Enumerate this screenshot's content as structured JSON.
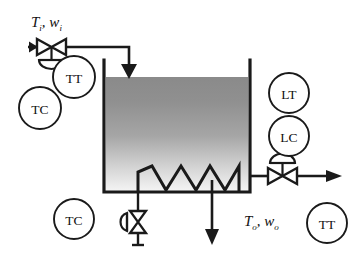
{
  "diagram": {
    "colors": {
      "line": "#1a1a1a",
      "liquid_top": "#8c8c8c",
      "liquid_bottom": "#f2f2f2",
      "background": "#ffffff"
    },
    "instruments": [
      {
        "id": "tt-inlet",
        "tag": "TT",
        "name": "inlet-temperature-transmitter",
        "cx": 74,
        "cy": 77,
        "r": 21
      },
      {
        "id": "tc-inlet",
        "tag": "TC",
        "name": "inlet-temperature-controller",
        "cx": 40,
        "cy": 108,
        "r": 21
      },
      {
        "id": "lt-level",
        "tag": "LT",
        "name": "level-transmitter",
        "cx": 289,
        "cy": 93,
        "r": 20
      },
      {
        "id": "lc-level",
        "tag": "LC",
        "name": "level-controller",
        "cx": 289,
        "cy": 136,
        "r": 20
      },
      {
        "id": "tc-steam",
        "tag": "TC",
        "name": "steam-temperature-controller",
        "cx": 74,
        "cy": 219,
        "r": 20
      },
      {
        "id": "tt-outlet",
        "tag": "TT",
        "name": "outlet-temperature-transmitter",
        "cx": 327,
        "cy": 223,
        "r": 20
      }
    ],
    "labels": {
      "inlet": {
        "var": "T",
        "var_sub": "i",
        "flow": "w",
        "flow_sub": "i",
        "text": "Ti , wi"
      },
      "outlet": {
        "var": "T",
        "var_sub": "o",
        "flow": "w",
        "flow_sub": "o",
        "text": "To , wo"
      }
    },
    "valves": [
      {
        "id": "inlet-valve",
        "name": "inlet-control-valve",
        "x": 47,
        "y": 47,
        "actuator": "diaphragm-down"
      },
      {
        "id": "outlet-valve",
        "name": "outlet-control-valve",
        "x": 285,
        "y": 176,
        "actuator": "diaphragm-up"
      },
      {
        "id": "steam-valve",
        "name": "steam-control-valve",
        "x": 138,
        "y": 222,
        "actuator": "diaphragm-left"
      }
    ],
    "tank": {
      "x": 104,
      "y": 60,
      "w": 146,
      "h": 132,
      "liquid_level_y": 77
    },
    "coil": {
      "name": "heating-coil",
      "peaks": 4
    },
    "flows": [
      {
        "id": "inlet-stream",
        "name": "inlet-flow-arrow",
        "direction": "down"
      },
      {
        "id": "outlet-stream",
        "name": "outlet-flow-arrow",
        "direction": "right"
      },
      {
        "id": "drain-stream",
        "name": "drain-flow-arrow",
        "direction": "down"
      },
      {
        "id": "steam-stream",
        "name": "steam-flow-arrow",
        "direction": "down"
      }
    ]
  }
}
